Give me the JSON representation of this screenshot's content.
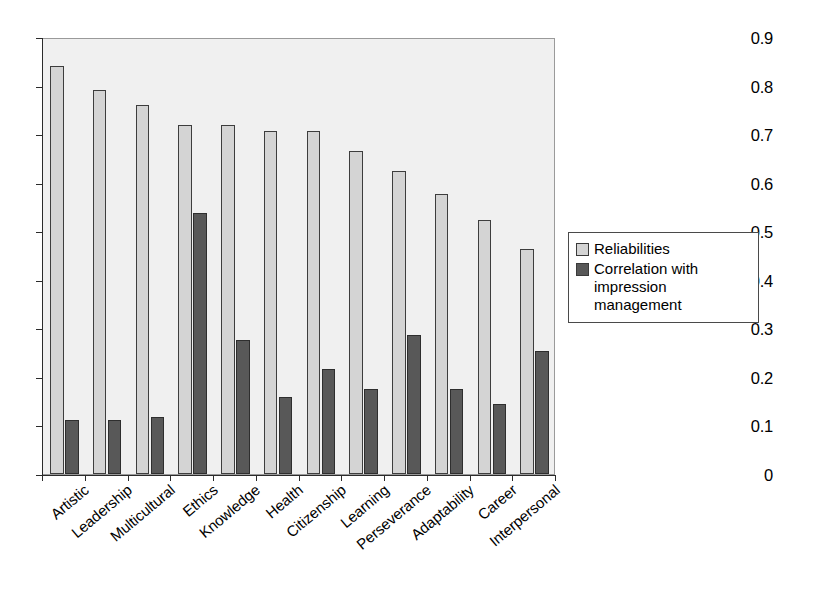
{
  "chart_data": {
    "type": "bar",
    "title": "",
    "subtitle": "",
    "xlabel": "",
    "ylabel": "",
    "ylim": [
      0,
      0.9
    ],
    "ytick_labels": [
      "0",
      "0.1",
      "0.2",
      "0.3",
      "0.4",
      "0.5",
      "0.6",
      "0.7",
      "0.8",
      "0.9"
    ],
    "ytick_values": [
      0,
      0.1,
      0.2,
      0.3,
      0.4,
      0.5,
      0.6,
      0.7,
      0.8,
      0.9
    ],
    "grid": false,
    "legend_position": "right",
    "categories": [
      "Artistic",
      "Leadership",
      "Multicultural",
      "Ethics",
      "Knowledge",
      "Health",
      "Citizenship",
      "Learning",
      "Perseverance",
      "Adaptability",
      "Career",
      "Interpersonal"
    ],
    "series": [
      {
        "name": "Reliabilities",
        "color": "#d4d4d4",
        "values": [
          0.84,
          0.79,
          0.76,
          0.718,
          0.718,
          0.706,
          0.706,
          0.666,
          0.625,
          0.576,
          0.523,
          0.463
        ]
      },
      {
        "name": "Correlation with impression management",
        "color": "#585858",
        "values": [
          0.111,
          0.111,
          0.118,
          0.537,
          0.277,
          0.158,
          0.216,
          0.175,
          0.286,
          0.175,
          0.144,
          0.253
        ]
      }
    ]
  },
  "legend": {
    "items": [
      {
        "label": "Reliabilities",
        "swatch": "light"
      },
      {
        "label": "Correlation with impression management",
        "swatch": "dark"
      }
    ]
  }
}
